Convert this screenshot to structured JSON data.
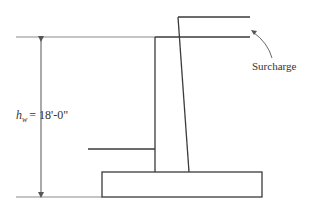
{
  "diagram": {
    "dimension_label": {
      "symbol": "h",
      "subscript": "w",
      "value": "= 18'-0\""
    },
    "annotation": "Surcharge",
    "colors": {
      "line": "#3a3a3a",
      "dim_line": "#8a8a8a",
      "text": "#333333"
    }
  }
}
